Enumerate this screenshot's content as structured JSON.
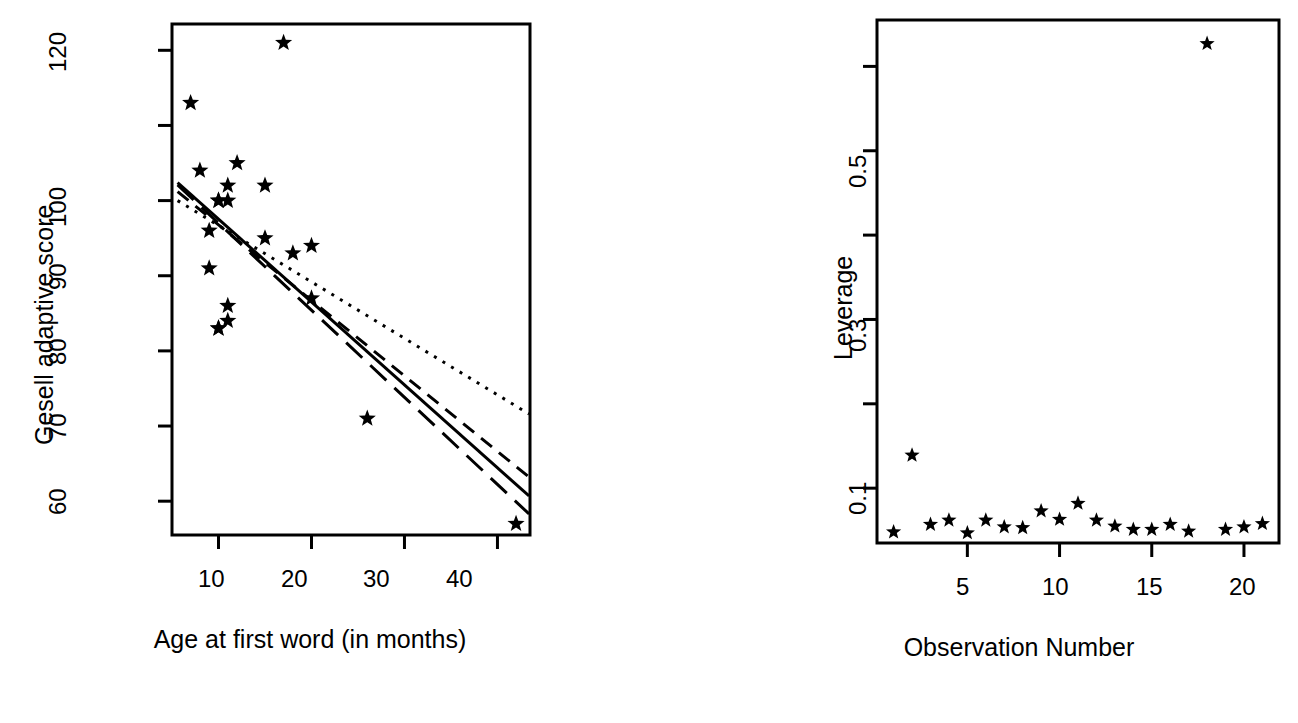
{
  "figure": {
    "background": "#ffffff",
    "foreground": "#000000",
    "panels": 2,
    "point_glyph": "*",
    "point_glyph_name": "asterisk-marker"
  },
  "chart_data": [
    {
      "id": "gesell-scatter",
      "type": "scatter",
      "title": "",
      "xlabel": "Age at first word (in months)",
      "ylabel": "Gesell adaptive score",
      "xlim": [
        5,
        43.5
      ],
      "ylim": [
        55.5,
        123.5
      ],
      "grid": false,
      "legend": "none",
      "xticks": [
        10,
        20,
        30,
        40
      ],
      "xtick_labels": [
        "10",
        "20",
        "30",
        "40"
      ],
      "yticks": [
        60,
        70,
        80,
        90,
        100,
        110,
        120
      ],
      "ytick_labels": [
        "60",
        "70",
        "80",
        "90",
        "100",
        "",
        "120"
      ],
      "x": [
        15,
        26,
        10,
        9,
        15,
        20,
        18,
        11,
        8,
        20,
        7,
        9,
        10,
        11,
        11,
        10,
        12,
        42,
        17,
        11,
        10
      ],
      "y": [
        95,
        71,
        83,
        91,
        102,
        87,
        93,
        100,
        104,
        94,
        113,
        96,
        83,
        84,
        102,
        100,
        105,
        57,
        121,
        86,
        100
      ],
      "series": [
        {
          "name": "Gesell observations",
          "marker": "asterisk",
          "points": [
            {
              "x": 15,
              "y": 95
            },
            {
              "x": 26,
              "y": 71
            },
            {
              "x": 10,
              "y": 83
            },
            {
              "x": 9,
              "y": 91
            },
            {
              "x": 15,
              "y": 102
            },
            {
              "x": 20,
              "y": 87
            },
            {
              "x": 18,
              "y": 93
            },
            {
              "x": 11,
              "y": 100
            },
            {
              "x": 8,
              "y": 104
            },
            {
              "x": 20,
              "y": 94
            },
            {
              "x": 7,
              "y": 113
            },
            {
              "x": 9,
              "y": 96
            },
            {
              "x": 10,
              "y": 83
            },
            {
              "x": 11,
              "y": 84
            },
            {
              "x": 11,
              "y": 102
            },
            {
              "x": 10,
              "y": 100
            },
            {
              "x": 12,
              "y": 105
            },
            {
              "x": 42,
              "y": 57
            },
            {
              "x": 17,
              "y": 121
            },
            {
              "x": 11,
              "y": 86
            },
            {
              "x": 10,
              "y": 100
            }
          ]
        }
      ],
      "lines": [
        {
          "name": "ordinary-least-squares",
          "style": "solid",
          "x_start": 5.6,
          "y_start": 102.4,
          "x_end": 43.4,
          "y_end": 60.7
        },
        {
          "name": "fit-dashed-upper",
          "style": "dashed",
          "x_start": 5.6,
          "y_start": 101.2,
          "x_end": 43.4,
          "y_end": 63.2
        },
        {
          "name": "fit-longdash-lower",
          "style": "longdash",
          "x_start": 5.6,
          "y_start": 102.1,
          "x_end": 43.4,
          "y_end": 58.3
        },
        {
          "name": "fit-dotted-robust",
          "style": "dotted",
          "x_start": 5.6,
          "y_start": 100.0,
          "x_end": 43.4,
          "y_end": 71.6
        }
      ]
    },
    {
      "id": "leverage-plot",
      "type": "scatter",
      "title": "",
      "xlabel": "Observation Number",
      "ylabel": "Leverage",
      "xlim": [
        0.1,
        21.9
      ],
      "ylim": [
        0.035,
        0.655
      ],
      "grid": false,
      "legend": "none",
      "xticks": [
        5,
        10,
        15,
        20
      ],
      "xtick_labels": [
        "5",
        "10",
        "15",
        "20"
      ],
      "yticks": [
        0.1,
        0.2,
        0.3,
        0.4,
        0.5,
        0.6
      ],
      "ytick_labels": [
        "0.1",
        "",
        "0.3",
        "",
        "0.5",
        ""
      ],
      "x": [
        1,
        2,
        3,
        4,
        5,
        6,
        7,
        8,
        9,
        10,
        11,
        12,
        13,
        14,
        15,
        16,
        17,
        18,
        19,
        20,
        21
      ],
      "y": [
        0.048,
        0.139,
        0.057,
        0.062,
        0.047,
        0.062,
        0.054,
        0.053,
        0.073,
        0.063,
        0.082,
        0.062,
        0.055,
        0.051,
        0.051,
        0.057,
        0.049,
        0.627,
        0.051,
        0.054,
        0.058
      ],
      "series": [
        {
          "name": "Leverage values",
          "marker": "asterisk",
          "points": [
            {
              "x": 1,
              "y": 0.048
            },
            {
              "x": 2,
              "y": 0.139
            },
            {
              "x": 3,
              "y": 0.057
            },
            {
              "x": 4,
              "y": 0.062
            },
            {
              "x": 5,
              "y": 0.047
            },
            {
              "x": 6,
              "y": 0.062
            },
            {
              "x": 7,
              "y": 0.054
            },
            {
              "x": 8,
              "y": 0.053
            },
            {
              "x": 9,
              "y": 0.073
            },
            {
              "x": 10,
              "y": 0.063
            },
            {
              "x": 11,
              "y": 0.082
            },
            {
              "x": 12,
              "y": 0.062
            },
            {
              "x": 13,
              "y": 0.055
            },
            {
              "x": 14,
              "y": 0.051
            },
            {
              "x": 15,
              "y": 0.051
            },
            {
              "x": 16,
              "y": 0.057
            },
            {
              "x": 17,
              "y": 0.049
            },
            {
              "x": 18,
              "y": 0.627
            },
            {
              "x": 19,
              "y": 0.051
            },
            {
              "x": 20,
              "y": 0.054
            },
            {
              "x": 21,
              "y": 0.058
            }
          ]
        }
      ],
      "lines": []
    }
  ]
}
